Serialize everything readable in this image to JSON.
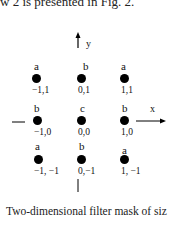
{
  "header": {
    "text": "w 2 is presented in Fig. 2."
  },
  "figure": {
    "axes": {
      "x_label": "x",
      "y_label": "y"
    },
    "points": [
      {
        "letter": "a",
        "coord": "−1,1"
      },
      {
        "letter": "b",
        "coord": "0,1"
      },
      {
        "letter": "a",
        "coord": "1,1"
      },
      {
        "letter": "b",
        "coord": "−1,0"
      },
      {
        "letter": "c",
        "coord": "0,0"
      },
      {
        "letter": "b",
        "coord": "1,0"
      },
      {
        "letter": "a",
        "coord": "−1, −1"
      },
      {
        "letter": "b",
        "coord": "0,−1"
      },
      {
        "letter": "a",
        "coord": "1, −1"
      }
    ],
    "caption": "Two-dimensional filter mask of siz"
  }
}
